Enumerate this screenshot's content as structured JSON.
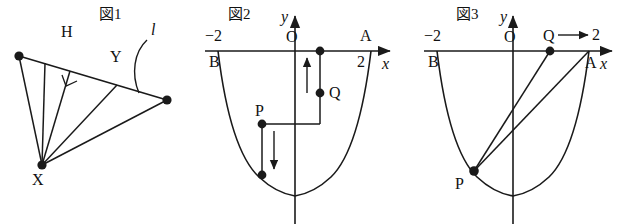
{
  "figures": [
    {
      "id": "fig1",
      "title": "図1",
      "labels": {
        "vertex_x": "X",
        "foot_h": "H",
        "point_y": "Y",
        "line_l": "l"
      },
      "description_points": {
        "x_point": [
          42,
          165
        ],
        "line_left_end": [
          19,
          56
        ],
        "line_right_end": [
          167,
          100
        ],
        "h_point": [
          70,
          71
        ],
        "y_point": [
          117,
          85
        ]
      }
    },
    {
      "id": "fig2",
      "title": "図2",
      "labels": {
        "y_axis": "y",
        "x_axis": "x",
        "origin": "O",
        "point_a": "A",
        "point_b": "B",
        "point_p": "P",
        "point_q": "Q",
        "tick_neg2": "−2",
        "tick_2": "2"
      },
      "arrows": {
        "q_arrow_direction": "up",
        "p_arrow_direction": "down"
      }
    },
    {
      "id": "fig3",
      "title": "図3",
      "labels": {
        "y_axis": "y",
        "x_axis": "x",
        "origin": "O",
        "point_a": "A",
        "point_b": "B",
        "point_p": "P",
        "point_q": "Q",
        "tick_neg2": "−2",
        "tick_2": "2"
      },
      "arrows": {
        "q_arrow_direction": "right"
      }
    }
  ],
  "colors": {
    "ink": "#1a1a1a",
    "paper": "#ffffff"
  }
}
